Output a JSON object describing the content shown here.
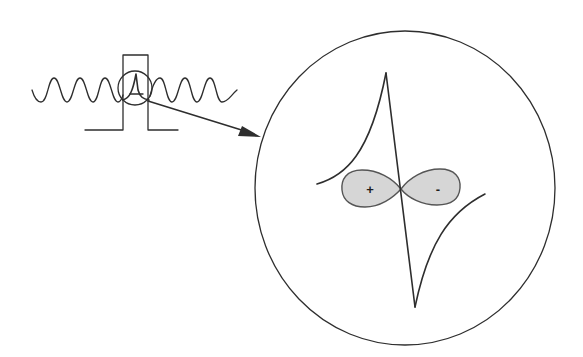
{
  "diagram": {
    "colors": {
      "line": "#2e2e2e",
      "lobe_fill": "#d6d6d6",
      "lobe_stroke": "#555555",
      "background": "#ffffff"
    },
    "left_figure": {
      "wave": "sinusoidal wave",
      "pulse": "rectangular pulse",
      "magnifier": "small circle highlighting cusp"
    },
    "arrow": {
      "from": [
        148,
        101
      ],
      "to": [
        260,
        137
      ]
    },
    "inset": {
      "shape": "large circle",
      "center": [
        405,
        188
      ],
      "radius_x": 150,
      "radius_y": 157,
      "lobes": [
        {
          "label": "+",
          "side": "left"
        },
        {
          "label": "-",
          "side": "right"
        }
      ]
    }
  }
}
